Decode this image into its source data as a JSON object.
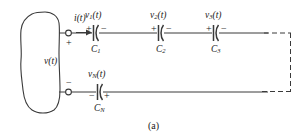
{
  "figure": {
    "caption": "(a)",
    "colors": {
      "line": "#3a3a3a",
      "text": "#1a1a1a",
      "background": "#ffffff"
    }
  },
  "source": {
    "name": "arbitrary-network-blob",
    "voltage_label": "v(t)",
    "top_terminal_sign": "+",
    "bottom_terminal_sign": "−"
  },
  "current": {
    "label": "i(t)"
  },
  "top_branch": {
    "capacitors": [
      {
        "voltage_label": "v",
        "voltage_sub": "1",
        "voltage_arg": "(t)",
        "name_label": "C",
        "name_sub": "1",
        "left_sign": "+",
        "right_sign": "−"
      },
      {
        "voltage_label": "v",
        "voltage_sub": "2",
        "voltage_arg": "(t)",
        "name_label": "C",
        "name_sub": "2",
        "left_sign": "+",
        "right_sign": "−"
      },
      {
        "voltage_label": "v",
        "voltage_sub": "3",
        "voltage_arg": "(t)",
        "name_label": "C",
        "name_sub": "3",
        "left_sign": "+",
        "right_sign": "−"
      }
    ]
  },
  "bottom_branch": {
    "capacitor": {
      "voltage_label": "v",
      "voltage_sub": "N",
      "voltage_arg": "(t)",
      "name_label": "C",
      "name_sub": "N",
      "left_sign": "−",
      "right_sign": "+"
    }
  }
}
